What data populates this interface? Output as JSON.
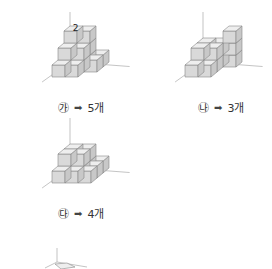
{
  "figures": [
    {
      "id": "ga",
      "mark": "㉮",
      "arrow": "➡",
      "answer": "5개",
      "top_number": "2",
      "origin": [
        70,
        62
      ],
      "label_pos": [
        58,
        99
      ],
      "cubes": [
        [
          0,
          0,
          0
        ],
        [
          1,
          0,
          0
        ],
        [
          2,
          0,
          0
        ],
        [
          0,
          1,
          0
        ],
        [
          1,
          1,
          0
        ],
        [
          2,
          1,
          0
        ],
        [
          0,
          2,
          0
        ],
        [
          1,
          2,
          0
        ],
        [
          0,
          0,
          1
        ],
        [
          1,
          0,
          1
        ],
        [
          0,
          1,
          1
        ],
        [
          1,
          1,
          1
        ],
        [
          0,
          0,
          2
        ],
        [
          1,
          0,
          2
        ]
      ]
    },
    {
      "id": "na",
      "mark": "㉯",
      "arrow": "➡",
      "answer": "3개",
      "origin": [
        203,
        62
      ],
      "label_pos": [
        198,
        99
      ],
      "cubes": [
        [
          0,
          0,
          0
        ],
        [
          1,
          0,
          0
        ],
        [
          0,
          1,
          0
        ],
        [
          1,
          1,
          0
        ],
        [
          0,
          2,
          0
        ],
        [
          1,
          2,
          0
        ],
        [
          0,
          0,
          1
        ],
        [
          1,
          0,
          1
        ],
        [
          0,
          1,
          1
        ],
        [
          1,
          1,
          1
        ],
        [
          2,
          0,
          0
        ],
        [
          2,
          0,
          1
        ],
        [
          2,
          0,
          2
        ]
      ]
    },
    {
      "id": "da",
      "mark": "㉰",
      "arrow": "➡",
      "answer": "4개",
      "origin": [
        70,
        168
      ],
      "label_pos": [
        58,
        205
      ],
      "cubes": [
        [
          0,
          0,
          0
        ],
        [
          1,
          0,
          0
        ],
        [
          2,
          0,
          0
        ],
        [
          0,
          1,
          0
        ],
        [
          1,
          1,
          0
        ],
        [
          2,
          1,
          0
        ],
        [
          0,
          2,
          0
        ],
        [
          1,
          2,
          0
        ],
        [
          2,
          2,
          0
        ],
        [
          0,
          0,
          1
        ],
        [
          1,
          0,
          1
        ],
        [
          0,
          1,
          1
        ],
        [
          1,
          1,
          1
        ]
      ]
    }
  ],
  "partial_figure": {
    "origin": [
      57,
      262
    ]
  },
  "colors": {
    "front": "#d9d9d9",
    "side": "#c8c8c8",
    "top": "#eeeeee",
    "edge": "#888888",
    "axis": "#aaaaaa",
    "text": "#333333"
  }
}
